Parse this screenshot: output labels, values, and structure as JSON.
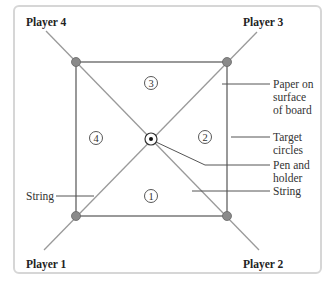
{
  "diagram": {
    "players": {
      "p1": "Player 1",
      "p2": "Player 2",
      "p3": "Player 3",
      "p4": "Player 4"
    },
    "regions": {
      "r1": "1",
      "r2": "2",
      "r3": "3",
      "r4": "4"
    },
    "callouts": {
      "paper_l1": "Paper on",
      "paper_l2": "surface",
      "paper_l3": "of board",
      "target_l1": "Target",
      "target_l2": "circles",
      "pen_l1": "Pen and",
      "pen_l2": "holder",
      "string_right": "String",
      "string_left": "String"
    },
    "colors": {
      "frame_border": "#d6d6d6",
      "square_line": "#555555",
      "string_line": "#9a9a9a",
      "corner_dot": "#8a8a8a",
      "text": "#222222"
    }
  }
}
